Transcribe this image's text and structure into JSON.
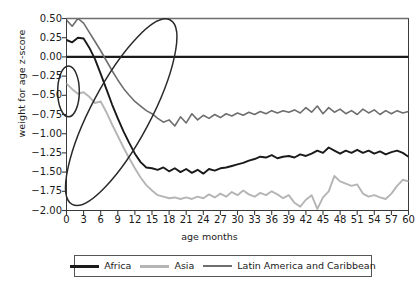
{
  "chart_data": {
    "type": "line",
    "title": "",
    "xlabel": "age months",
    "ylabel": "weight for age z-score",
    "xlim": [
      0,
      60
    ],
    "ylim": [
      -2.0,
      0.5
    ],
    "grid": false,
    "legend_position": "bottom",
    "x_ticks": [
      "0",
      "3",
      "6",
      "9",
      "12",
      "15",
      "18",
      "21",
      "24",
      "27",
      "30",
      "33",
      "36",
      "39",
      "42",
      "45",
      "48",
      "51",
      "54",
      "57",
      "60"
    ],
    "y_ticks": [
      "0.50",
      "0.25",
      "0.00",
      "-0.25",
      "-0.50",
      "-0.75",
      "-1.00",
      "-1.25",
      "-1.50",
      "-1.75",
      "-2.00"
    ],
    "x": [
      0,
      1,
      2,
      3,
      4,
      5,
      6,
      7,
      8,
      9,
      10,
      11,
      12,
      13,
      14,
      15,
      16,
      17,
      18,
      19,
      20,
      21,
      22,
      23,
      24,
      25,
      26,
      27,
      28,
      29,
      30,
      31,
      32,
      33,
      34,
      35,
      36,
      37,
      38,
      39,
      40,
      41,
      42,
      43,
      44,
      45,
      46,
      47,
      48,
      49,
      50,
      51,
      52,
      53,
      54,
      55,
      56,
      57,
      58,
      59,
      60
    ],
    "series": [
      {
        "name": "Africa",
        "color": "#1a1a1a",
        "width": 1.9,
        "values": [
          0.22,
          0.19,
          0.25,
          0.24,
          0.12,
          -0.03,
          -0.22,
          -0.42,
          -0.62,
          -0.8,
          -0.97,
          -1.12,
          -1.26,
          -1.37,
          -1.44,
          -1.45,
          -1.47,
          -1.44,
          -1.49,
          -1.45,
          -1.5,
          -1.46,
          -1.51,
          -1.47,
          -1.52,
          -1.46,
          -1.48,
          -1.45,
          -1.44,
          -1.42,
          -1.4,
          -1.38,
          -1.35,
          -1.33,
          -1.3,
          -1.31,
          -1.28,
          -1.32,
          -1.3,
          -1.29,
          -1.31,
          -1.27,
          -1.29,
          -1.26,
          -1.22,
          -1.25,
          -1.18,
          -1.22,
          -1.26,
          -1.22,
          -1.25,
          -1.21,
          -1.25,
          -1.22,
          -1.26,
          -1.23,
          -1.27,
          -1.24,
          -1.22,
          -1.25,
          -1.3
        ]
      },
      {
        "name": "Asia",
        "color": "#b5b5b5",
        "width": 1.9,
        "values": [
          -0.35,
          -0.42,
          -0.48,
          -0.46,
          -0.52,
          -0.6,
          -0.58,
          -0.72,
          -0.88,
          -1.03,
          -1.18,
          -1.32,
          -1.45,
          -1.57,
          -1.67,
          -1.74,
          -1.8,
          -1.82,
          -1.84,
          -1.83,
          -1.85,
          -1.83,
          -1.85,
          -1.82,
          -1.84,
          -1.79,
          -1.83,
          -1.78,
          -1.82,
          -1.76,
          -1.8,
          -1.74,
          -1.79,
          -1.82,
          -1.77,
          -1.8,
          -1.75,
          -1.79,
          -1.84,
          -1.8,
          -1.9,
          -1.95,
          -1.86,
          -1.8,
          -1.98,
          -1.83,
          -1.75,
          -1.55,
          -1.62,
          -1.65,
          -1.68,
          -1.66,
          -1.78,
          -1.82,
          -1.8,
          -1.83,
          -1.85,
          -1.78,
          -1.68,
          -1.6,
          -1.62
        ]
      },
      {
        "name": "Latin America and Caribbean",
        "color": "#6e6e6e",
        "width": 1.6,
        "values": [
          0.48,
          0.4,
          0.5,
          0.44,
          0.32,
          0.2,
          0.08,
          -0.05,
          -0.18,
          -0.3,
          -0.41,
          -0.5,
          -0.58,
          -0.64,
          -0.7,
          -0.74,
          -0.8,
          -0.85,
          -0.82,
          -0.9,
          -0.78,
          -0.86,
          -0.74,
          -0.82,
          -0.76,
          -0.8,
          -0.75,
          -0.79,
          -0.74,
          -0.77,
          -0.73,
          -0.76,
          -0.72,
          -0.75,
          -0.71,
          -0.74,
          -0.7,
          -0.73,
          -0.7,
          -0.72,
          -0.69,
          -0.73,
          -0.66,
          -0.72,
          -0.64,
          -0.74,
          -0.66,
          -0.72,
          -0.68,
          -0.74,
          -0.7,
          -0.75,
          -0.68,
          -0.73,
          -0.69,
          -0.75,
          -0.7,
          -0.74,
          -0.7,
          -0.73,
          -0.71
        ]
      }
    ],
    "reference_lines": [
      {
        "name": "zero-line",
        "y": 0.0,
        "color": "#1a1a1a",
        "width": 2.2
      },
      {
        "name": "top-line",
        "y": 0.5,
        "color": "#6e6e6e",
        "width": 1.6
      }
    ],
    "annotations": [
      {
        "name": "small-ellipse",
        "cx": 0.35,
        "cy": -0.45,
        "rx": 1.9,
        "ry": 0.33,
        "rotation": 0
      },
      {
        "name": "large-ellipse",
        "cx": 9.6,
        "cy": -0.72,
        "rx": 5.2,
        "ry": 1.36,
        "rotation": 28
      }
    ]
  },
  "axes": {
    "ylabel": "weight for age z-score",
    "xlabel": "age months"
  },
  "legend": {
    "items": [
      {
        "label": "Africa"
      },
      {
        "label": "Asia"
      },
      {
        "label": "Latin America and Caribbean"
      }
    ]
  }
}
